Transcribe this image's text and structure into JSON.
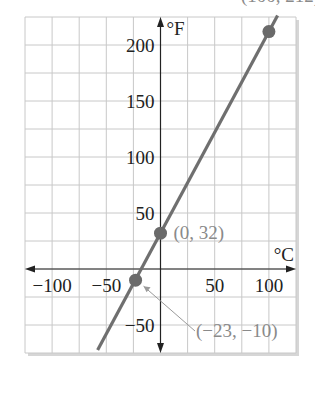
{
  "chart_data": {
    "type": "line",
    "title": "",
    "xlabel": "°C",
    "ylabel": "°F",
    "xlim": [
      -125,
      125
    ],
    "ylim": [
      -75,
      225
    ],
    "grid": true,
    "grid_step": {
      "x": 25,
      "y": 25
    },
    "x_ticks": [
      -100,
      -50,
      50,
      100
    ],
    "x_tick_labels": [
      "−100",
      "−50",
      "50",
      "100"
    ],
    "y_ticks": [
      -50,
      50,
      100,
      150,
      200
    ],
    "y_tick_labels": [
      "−50",
      "50",
      "100",
      "150",
      "200"
    ],
    "series": [
      {
        "name": "F = 9/5 C + 32",
        "line_x": [
          -58,
          108
        ],
        "line_y": [
          -72.4,
          226.4
        ],
        "color": "#6f6f6f"
      }
    ],
    "points": [
      {
        "x": 100,
        "y": 212,
        "label": "(100, 212)"
      },
      {
        "x": 0,
        "y": 32,
        "label": "(0, 32)"
      },
      {
        "x": -23,
        "y": -10,
        "label": "(−23, −10)"
      }
    ],
    "colors": {
      "grid": "#c8c8c8",
      "axis": "#222222",
      "line": "#6f6f6f",
      "point": "#6a6a6a",
      "annotation": "#8a8a8a",
      "shadow": "#d6d6d6"
    }
  }
}
